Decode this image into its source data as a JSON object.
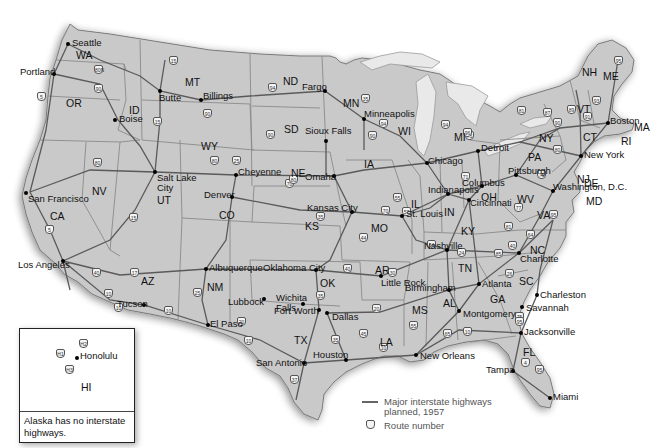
{
  "map": {
    "title": "Interstate Highway System, 1957",
    "states": [
      {
        "abbr": "WA",
        "x": 76,
        "y": 49
      },
      {
        "abbr": "OR",
        "x": 66,
        "y": 97
      },
      {
        "abbr": "ID",
        "x": 129,
        "y": 104
      },
      {
        "abbr": "MT",
        "x": 185,
        "y": 76
      },
      {
        "abbr": "WY",
        "x": 201,
        "y": 140
      },
      {
        "abbr": "ND",
        "x": 283,
        "y": 75
      },
      {
        "abbr": "SD",
        "x": 284,
        "y": 123
      },
      {
        "abbr": "NE",
        "x": 291,
        "y": 167
      },
      {
        "abbr": "MN",
        "x": 343,
        "y": 97
      },
      {
        "abbr": "WI",
        "x": 398,
        "y": 125
      },
      {
        "abbr": "MI",
        "x": 454,
        "y": 131
      },
      {
        "abbr": "IA",
        "x": 364,
        "y": 158
      },
      {
        "abbr": "IL",
        "x": 411,
        "y": 198
      },
      {
        "abbr": "IN",
        "x": 444,
        "y": 206
      },
      {
        "abbr": "OH",
        "x": 481,
        "y": 191
      },
      {
        "abbr": "PA",
        "x": 528,
        "y": 151
      },
      {
        "abbr": "NY",
        "x": 539,
        "y": 132
      },
      {
        "abbr": "VT",
        "x": 577,
        "y": 103
      },
      {
        "abbr": "NH",
        "x": 582,
        "y": 66
      },
      {
        "abbr": "ME",
        "x": 603,
        "y": 70
      },
      {
        "abbr": "MA",
        "x": 634,
        "y": 121
      },
      {
        "abbr": "RI",
        "x": 621,
        "y": 135
      },
      {
        "abbr": "CT",
        "x": 583,
        "y": 131
      },
      {
        "abbr": "NJ",
        "x": 577,
        "y": 173
      },
      {
        "abbr": "DE",
        "x": 584,
        "y": 177
      },
      {
        "abbr": "MD",
        "x": 586,
        "y": 195
      },
      {
        "abbr": "WV",
        "x": 517,
        "y": 193
      },
      {
        "abbr": "VA",
        "x": 537,
        "y": 209
      },
      {
        "abbr": "KY",
        "x": 461,
        "y": 225
      },
      {
        "abbr": "TN",
        "x": 458,
        "y": 262
      },
      {
        "abbr": "NC",
        "x": 530,
        "y": 244
      },
      {
        "abbr": "SC",
        "x": 519,
        "y": 275
      },
      {
        "abbr": "GA",
        "x": 490,
        "y": 293
      },
      {
        "abbr": "AL",
        "x": 443,
        "y": 297
      },
      {
        "abbr": "MS",
        "x": 412,
        "y": 304
      },
      {
        "abbr": "FL",
        "x": 523,
        "y": 346
      },
      {
        "abbr": "LA",
        "x": 380,
        "y": 336
      },
      {
        "abbr": "AR",
        "x": 375,
        "y": 264
      },
      {
        "abbr": "MO",
        "x": 371,
        "y": 222
      },
      {
        "abbr": "KS",
        "x": 305,
        "y": 220
      },
      {
        "abbr": "OK",
        "x": 320,
        "y": 277
      },
      {
        "abbr": "TX",
        "x": 294,
        "y": 334
      },
      {
        "abbr": "NM",
        "x": 207,
        "y": 281
      },
      {
        "abbr": "AZ",
        "x": 141,
        "y": 275
      },
      {
        "abbr": "CO",
        "x": 219,
        "y": 209
      },
      {
        "abbr": "UT",
        "x": 157,
        "y": 194
      },
      {
        "abbr": "NV",
        "x": 92,
        "y": 185
      },
      {
        "abbr": "CA",
        "x": 50,
        "y": 210
      }
    ],
    "cities": [
      {
        "name": "Seattle",
        "x": 68,
        "y": 44,
        "lx": 72,
        "ly": 38
      },
      {
        "name": "Portland",
        "x": 54,
        "y": 74,
        "lx": 20,
        "ly": 67
      },
      {
        "name": "Boise",
        "x": 115,
        "y": 120,
        "lx": 119,
        "ly": 114
      },
      {
        "name": "Butte",
        "x": 160,
        "y": 91,
        "lx": 159,
        "ly": 93
      },
      {
        "name": "Billings",
        "x": 201,
        "y": 100,
        "lx": 203,
        "ly": 91
      },
      {
        "name": "Fargo",
        "x": 325,
        "y": 91,
        "lx": 302,
        "ly": 82
      },
      {
        "name": "Minneapolis",
        "x": 364,
        "y": 119,
        "lx": 364,
        "ly": 109
      },
      {
        "name": "Sioux Falls",
        "x": 326,
        "y": 141,
        "lx": 305,
        "ly": 126
      },
      {
        "name": "Seattle WA",
        "x": 0,
        "y": 0,
        "lx": 0,
        "ly": 0,
        "hidden": true
      },
      {
        "name": "Salt Lake City",
        "x": 155,
        "y": 172,
        "lx": 157,
        "ly": 173
      },
      {
        "name": "Cheyenne",
        "x": 236,
        "y": 175,
        "lx": 238,
        "ly": 167
      },
      {
        "name": "Denver",
        "x": 232,
        "y": 197,
        "lx": 204,
        "ly": 190
      },
      {
        "name": "Omaha",
        "x": 334,
        "y": 176,
        "lx": 305,
        "ly": 172
      },
      {
        "name": "Kansas City",
        "x": 352,
        "y": 212,
        "lx": 307,
        "ly": 203
      },
      {
        "name": "St. Louis",
        "x": 402,
        "y": 216,
        "lx": 406,
        "ly": 209
      },
      {
        "name": "Chicago",
        "x": 427,
        "y": 163,
        "lx": 428,
        "ly": 156
      },
      {
        "name": "Detroit",
        "x": 478,
        "y": 151,
        "lx": 481,
        "ly": 143
      },
      {
        "name": "Indianapolis",
        "x": 448,
        "y": 194,
        "lx": 428,
        "ly": 185
      },
      {
        "name": "Columbus",
        "x": 482,
        "y": 186,
        "lx": 462,
        "ly": 178
      },
      {
        "name": "Cincinnati",
        "x": 469,
        "y": 200,
        "lx": 470,
        "ly": 198
      },
      {
        "name": "Pittsburgh",
        "x": 516,
        "y": 175,
        "lx": 508,
        "ly": 166
      },
      {
        "name": "New York",
        "x": 581,
        "y": 156,
        "lx": 584,
        "ly": 150
      },
      {
        "name": "Boston",
        "x": 608,
        "y": 123,
        "lx": 610,
        "ly": 116
      },
      {
        "name": "Washington, D.C.",
        "x": 553,
        "y": 191,
        "lx": 553,
        "ly": 182
      },
      {
        "name": "Nashville",
        "x": 447,
        "y": 250,
        "lx": 424,
        "ly": 241
      },
      {
        "name": "Charlotte",
        "x": 519,
        "y": 253,
        "lx": 520,
        "ly": 254
      },
      {
        "name": "Atlanta",
        "x": 479,
        "y": 284,
        "lx": 482,
        "ly": 279
      },
      {
        "name": "Birmingham",
        "x": 449,
        "y": 290,
        "lx": 405,
        "ly": 283
      },
      {
        "name": "Montgomery",
        "x": 459,
        "y": 311,
        "lx": 463,
        "ly": 309
      },
      {
        "name": "Charleston",
        "x": 537,
        "y": 295,
        "lx": 540,
        "ly": 290
      },
      {
        "name": "Savannah",
        "x": 522,
        "y": 307,
        "lx": 526,
        "ly": 303
      },
      {
        "name": "Jacksonville",
        "x": 521,
        "y": 333,
        "lx": 524,
        "ly": 327
      },
      {
        "name": "Tampa",
        "x": 513,
        "y": 371,
        "lx": 486,
        "ly": 365
      },
      {
        "name": "Miami",
        "x": 550,
        "y": 398,
        "lx": 553,
        "ly": 392
      },
      {
        "name": "New Orleans",
        "x": 416,
        "y": 355,
        "lx": 420,
        "ly": 351
      },
      {
        "name": "Little Rock",
        "x": 381,
        "y": 276,
        "lx": 381,
        "ly": 278
      },
      {
        "name": "Oklahoma City",
        "x": 316,
        "y": 270,
        "lx": 263,
        "ly": 263
      },
      {
        "name": "Albuquerque",
        "x": 206,
        "y": 269,
        "lx": 209,
        "ly": 263
      },
      {
        "name": "Lubbock",
        "x": 264,
        "y": 299,
        "lx": 228,
        "ly": 297
      },
      {
        "name": "Wichita Falls",
        "x": 303,
        "y": 304,
        "lx": 276,
        "ly": 293
      },
      {
        "name": "Fort Worth",
        "x": 319,
        "y": 310,
        "lx": 274,
        "ly": 306
      },
      {
        "name": "Dallas",
        "x": 327,
        "y": 313,
        "lx": 332,
        "ly": 312
      },
      {
        "name": "Houston",
        "x": 346,
        "y": 360,
        "lx": 313,
        "ly": 350
      },
      {
        "name": "San Antonio",
        "x": 304,
        "y": 363,
        "lx": 256,
        "ly": 358
      },
      {
        "name": "El Paso",
        "x": 208,
        "y": 325,
        "lx": 210,
        "ly": 319
      },
      {
        "name": "Tucson",
        "x": 144,
        "y": 305,
        "lx": 117,
        "ly": 299
      },
      {
        "name": "Los Angeles",
        "x": 63,
        "y": 261,
        "lx": 18,
        "ly": 260
      },
      {
        "name": "San Francisco",
        "x": 26,
        "y": 193,
        "lx": 28,
        "ly": 194
      }
    ],
    "route_shields": [
      {
        "num": "5",
        "x": 41,
        "y": 96
      },
      {
        "num": "90",
        "x": 98,
        "y": 88
      },
      {
        "num": "80N",
        "x": 98,
        "y": 69
      },
      {
        "num": "15",
        "x": 157,
        "y": 121
      },
      {
        "num": "15",
        "x": 173,
        "y": 60
      },
      {
        "num": "90",
        "x": 207,
        "y": 113
      },
      {
        "num": "94",
        "x": 272,
        "y": 87
      },
      {
        "num": "90",
        "x": 270,
        "y": 134
      },
      {
        "num": "35",
        "x": 365,
        "y": 98
      },
      {
        "num": "94",
        "x": 383,
        "y": 123
      },
      {
        "num": "90",
        "x": 372,
        "y": 135
      },
      {
        "num": "95",
        "x": 618,
        "y": 60
      },
      {
        "num": "93",
        "x": 596,
        "y": 100
      },
      {
        "num": "89",
        "x": 571,
        "y": 109
      },
      {
        "num": "91",
        "x": 587,
        "y": 116
      },
      {
        "num": "87",
        "x": 547,
        "y": 112
      },
      {
        "num": "81",
        "x": 521,
        "y": 110
      },
      {
        "num": "90",
        "x": 557,
        "y": 122
      },
      {
        "num": "80",
        "x": 97,
        "y": 162
      },
      {
        "num": "15",
        "x": 133,
        "y": 217
      },
      {
        "num": "5",
        "x": 49,
        "y": 229
      },
      {
        "num": "40",
        "x": 96,
        "y": 272
      },
      {
        "num": "17",
        "x": 134,
        "y": 272
      },
      {
        "num": "10",
        "x": 108,
        "y": 293
      },
      {
        "num": "10",
        "x": 118,
        "y": 307
      },
      {
        "num": "80",
        "x": 214,
        "y": 160
      },
      {
        "num": "25",
        "x": 236,
        "y": 160
      },
      {
        "num": "70",
        "x": 289,
        "y": 183
      },
      {
        "num": "80",
        "x": 293,
        "y": 179
      },
      {
        "num": "35",
        "x": 320,
        "y": 216
      },
      {
        "num": "70",
        "x": 385,
        "y": 210
      },
      {
        "num": "44",
        "x": 363,
        "y": 237
      },
      {
        "num": "40",
        "x": 347,
        "y": 268
      },
      {
        "num": "30",
        "x": 392,
        "y": 272
      },
      {
        "num": "35",
        "x": 320,
        "y": 295
      },
      {
        "num": "25",
        "x": 197,
        "y": 292
      },
      {
        "num": "10",
        "x": 168,
        "y": 310
      },
      {
        "num": "20",
        "x": 241,
        "y": 321
      },
      {
        "num": "10",
        "x": 248,
        "y": 340
      },
      {
        "num": "45",
        "x": 363,
        "y": 333
      },
      {
        "num": "35",
        "x": 335,
        "y": 339
      },
      {
        "num": "20",
        "x": 376,
        "y": 308
      },
      {
        "num": "10",
        "x": 383,
        "y": 347
      },
      {
        "num": "37",
        "x": 294,
        "y": 379
      },
      {
        "num": "55",
        "x": 413,
        "y": 325
      },
      {
        "num": "65",
        "x": 447,
        "y": 333
      },
      {
        "num": "75",
        "x": 519,
        "y": 316
      },
      {
        "num": "95",
        "x": 519,
        "y": 321
      },
      {
        "num": "4",
        "x": 525,
        "y": 362
      },
      {
        "num": "95",
        "x": 539,
        "y": 369
      },
      {
        "num": "10",
        "x": 467,
        "y": 331
      },
      {
        "num": "85",
        "x": 498,
        "y": 253
      },
      {
        "num": "77",
        "x": 518,
        "y": 207
      },
      {
        "num": "81",
        "x": 508,
        "y": 226
      },
      {
        "num": "64",
        "x": 530,
        "y": 234
      },
      {
        "num": "95",
        "x": 553,
        "y": 214
      },
      {
        "num": "71",
        "x": 465,
        "y": 176
      },
      {
        "num": "75",
        "x": 469,
        "y": 135
      },
      {
        "num": "94",
        "x": 445,
        "y": 124
      },
      {
        "num": "96",
        "x": 467,
        "y": 132
      },
      {
        "num": "80",
        "x": 557,
        "y": 149
      },
      {
        "num": "76",
        "x": 541,
        "y": 174
      },
      {
        "num": "55",
        "x": 397,
        "y": 197
      },
      {
        "num": "57",
        "x": 406,
        "y": 211
      },
      {
        "num": "64",
        "x": 431,
        "y": 244
      },
      {
        "num": "24",
        "x": 461,
        "y": 252
      },
      {
        "num": "40",
        "x": 512,
        "y": 245
      },
      {
        "num": "26",
        "x": 509,
        "y": 273
      }
    ]
  },
  "inset": {
    "state": "HI",
    "city": "Honolulu",
    "shields": [
      "H1",
      "H2",
      "H3"
    ],
    "note": "Alaska has no interstate highways."
  },
  "legend": {
    "line_label_1": "Major interstate highways",
    "line_label_2": "planned, 1957",
    "shield_label": "Route number"
  }
}
